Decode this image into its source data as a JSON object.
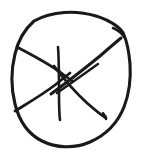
{
  "canvas": {
    "width": 146,
    "height": 160,
    "background_color": "#ffffff",
    "title": "hand-drawn circle with internal radiating lines"
  },
  "ink": {
    "color": "#1a1a1a",
    "style": "hand-drawn pen sketch",
    "medium": "black ink on white paper"
  },
  "figure": {
    "type": "sketch",
    "stroke_count": 7
  },
  "strokes": [
    {
      "name": "outer-circle",
      "role": "boundary",
      "thickness": 3.1,
      "path": "M 34 21 C 52 11 76 10 96 16 C 112 21 122 29 124 35 C 127 42 129 52 130 64 C 131 78 129 94 124 107 C 118 122 106 135 90 142 C 74 149 56 148 42 141 C 28 134 19 120 15 104 C 11 88 11 70 15 54 C 18 41 25 29 34 21 Z"
    },
    {
      "name": "circle-tail-overshoot",
      "role": "boundary-overshoot",
      "thickness": 2.6,
      "path": "M 113 28 C 118 30 122 33 124 37"
    },
    {
      "name": "upper-left-radial-line",
      "role": "internal-line",
      "thickness": 2.8,
      "path": "M 17 47 C 30 54 46 62 60 72 C 64 75 68 78 72 81"
    },
    {
      "name": "lower-left-radial-line",
      "role": "internal-line",
      "thickness": 2.8,
      "path": "M 15 111 C 28 103 42 95 55 85 C 60 81 65 77 70 73"
    },
    {
      "name": "vertical-line",
      "role": "internal-line",
      "thickness": 2.6,
      "path": "M 58 47 C 59 60 59 76 59 92 C 59 104 59 113 60 120"
    },
    {
      "name": "upper-right-diagonal-line",
      "role": "internal-line",
      "thickness": 3.0,
      "path": "M 51 94 C 66 83 84 69 100 56 C 108 49 115 43 121 38"
    },
    {
      "name": "upper-right-short-parallel-line",
      "role": "internal-line",
      "thickness": 2.4,
      "path": "M 57 93 C 70 84 84 74 98 64"
    },
    {
      "name": "lower-right-diagonal-line",
      "role": "internal-line",
      "thickness": 2.8,
      "path": "M 54 66 C 63 78 75 92 87 103 C 95 110 101 115 106 118"
    },
    {
      "name": "lower-right-line-hook-terminal",
      "role": "stroke-terminal",
      "thickness": 2.4,
      "path": "M 103 113 C 105 115 106 117 106 119"
    }
  ]
}
